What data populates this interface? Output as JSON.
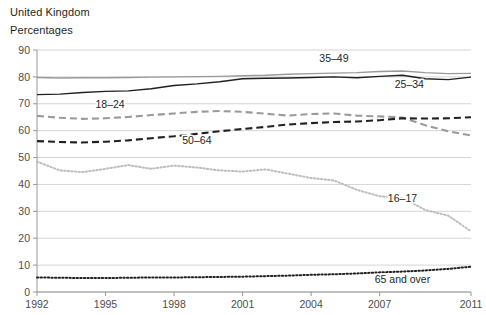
{
  "header": {
    "region": "United Kingdom",
    "units": "Percentages"
  },
  "chart_data": {
    "type": "line",
    "title": "United Kingdom",
    "subtitle": "Percentages",
    "xlabel": "",
    "ylabel": "Percentages",
    "ylim": [
      0,
      90
    ],
    "ytick_labels": [
      "0",
      "10",
      "20",
      "30",
      "40",
      "50",
      "60",
      "70",
      "80",
      "90"
    ],
    "yticks": [
      0,
      10,
      20,
      30,
      40,
      50,
      60,
      70,
      80,
      90
    ],
    "xlim": [
      1992,
      2011
    ],
    "xtick_labels": [
      "1992",
      "1995",
      "1998",
      "2001",
      "2004",
      "2007",
      "2011"
    ],
    "xticks": [
      1992,
      1995,
      1998,
      2001,
      2004,
      2007,
      2011
    ],
    "grid": true,
    "legend_position": "inline-annotations",
    "x": [
      1992,
      1993,
      1994,
      1995,
      1996,
      1997,
      1998,
      1999,
      2000,
      2001,
      2002,
      2003,
      2004,
      2005,
      2006,
      2007,
      2008,
      2009,
      2010,
      2011
    ],
    "series": [
      {
        "name": "35–49",
        "label": "35–49",
        "color": "#9a9a9a",
        "style": "solid",
        "label_x": 2005.0,
        "label_y": 85.5,
        "values": [
          79.8,
          79.6,
          79.7,
          79.7,
          79.8,
          79.9,
          80.0,
          80.1,
          80.2,
          80.4,
          80.6,
          81.0,
          81.2,
          81.4,
          81.6,
          82.0,
          82.2,
          81.6,
          81.2,
          81.3
        ]
      },
      {
        "name": "25–34",
        "label": "25–34",
        "color": "#231f20",
        "style": "solid",
        "label_x": 2008.3,
        "label_y": 76.0,
        "values": [
          73.4,
          73.6,
          74.2,
          74.6,
          74.8,
          75.6,
          76.8,
          77.4,
          78.2,
          79.3,
          79.5,
          79.6,
          79.8,
          80.0,
          79.7,
          80.2,
          80.6,
          79.3,
          79.0,
          79.9
        ]
      },
      {
        "name": "18–24",
        "label": "18–24",
        "color": "#9a9a9a",
        "style": "dashed",
        "label_x": 1995.2,
        "label_y": 68.5,
        "values": [
          65.5,
          64.8,
          64.4,
          64.6,
          65.1,
          65.8,
          66.4,
          67.0,
          67.3,
          67.0,
          66.3,
          65.6,
          66.2,
          66.4,
          65.6,
          65.3,
          64.9,
          62.0,
          59.8,
          58.2
        ]
      },
      {
        "name": "50–64",
        "label": "50–64",
        "color": "#231f20",
        "style": "dashed",
        "label_x": 1999.0,
        "label_y": 55.0,
        "values": [
          56.1,
          55.8,
          55.6,
          55.9,
          56.4,
          57.2,
          57.9,
          58.8,
          59.8,
          60.6,
          61.4,
          62.3,
          62.8,
          63.2,
          63.4,
          63.9,
          64.6,
          64.5,
          64.6,
          65.0
        ]
      },
      {
        "name": "16–17",
        "label": "16–17",
        "color": "#bdbdbd",
        "style": "dotted",
        "label_x": 2008.0,
        "label_y": 33.5,
        "values": [
          48.5,
          45.2,
          44.6,
          45.8,
          47.2,
          45.8,
          47.0,
          46.3,
          45.2,
          44.8,
          45.6,
          44.0,
          42.4,
          41.5,
          38.0,
          35.6,
          35.0,
          30.5,
          28.4,
          22.6
        ]
      },
      {
        "name": "65 and over",
        "label": "65 and over",
        "color": "#231f20",
        "style": "dotted",
        "label_x": 2008.0,
        "label_y": 3.5,
        "values": [
          5.4,
          5.3,
          5.2,
          5.2,
          5.3,
          5.4,
          5.4,
          5.5,
          5.6,
          5.7,
          5.9,
          6.1,
          6.4,
          6.6,
          6.9,
          7.3,
          7.6,
          8.0,
          8.6,
          9.4
        ]
      }
    ]
  }
}
